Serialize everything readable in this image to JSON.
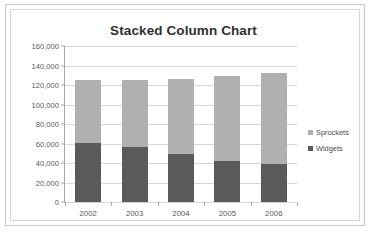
{
  "chart_data": {
    "type": "bar",
    "subtype": "stacked-column",
    "title": "Stacked Column Chart",
    "xlabel": "",
    "ylabel": "",
    "categories": [
      "2002",
      "2003",
      "2004",
      "2005",
      "2006"
    ],
    "series": [
      {
        "name": "Widgets",
        "color": "#5a5a5a",
        "values": [
          60500,
          56000,
          49000,
          42000,
          38500
        ]
      },
      {
        "name": "Sprockets",
        "color": "#b0b0b0",
        "values": [
          64500,
          69000,
          77000,
          87500,
          93500
        ]
      }
    ],
    "totals": [
      125000,
      125000,
      126000,
      129500,
      132000
    ],
    "ylim": [
      0,
      160000
    ],
    "ytick_step": 20000,
    "ytick_labels": [
      "160,000",
      "140,000",
      "120,000",
      "100,000",
      "80,000",
      "60,000",
      "40,000",
      "20,000",
      "0"
    ],
    "ytick_values": [
      160000,
      140000,
      120000,
      100000,
      80000,
      60000,
      40000,
      20000,
      0
    ],
    "grid": true,
    "grid_axis": "y",
    "legend": true,
    "legend_position": "right",
    "legend_entries": [
      {
        "label": "Sprockets",
        "color": "#b0b0b0"
      },
      {
        "label": "Widgets",
        "color": "#5a5a5a"
      }
    ],
    "plot_background": "#ffffff",
    "grid_color": "#d8d8d8",
    "axis_color": "#a8a8a8",
    "text_color": "#595959",
    "title_color": "#2f2f2f"
  }
}
